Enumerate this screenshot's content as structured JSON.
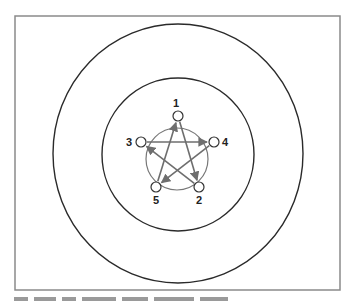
{
  "diagram": {
    "type": "communication-network",
    "shape": "star-pentagram",
    "frame": {
      "x": 15,
      "y": 16,
      "width": 325,
      "height": 274,
      "stroke": "#8a8a8a"
    },
    "outer_ring": {
      "cx": 178,
      "cy": 153.5,
      "rx": 125,
      "ry": 129.5,
      "stroke": "#2a2a2a"
    },
    "inner_ring": {
      "cx": 178,
      "cy": 154.5,
      "rx": 76,
      "ry": 76.5,
      "stroke": "#2a2a2a"
    },
    "hub_circle": {
      "cx": 177,
      "cy": 159,
      "r": 31,
      "stroke": "#777777"
    },
    "nodes": [
      {
        "id": "1",
        "label": "1",
        "cx": 178,
        "cy": 116
      },
      {
        "id": "2",
        "label": "2",
        "cx": 199,
        "cy": 187
      },
      {
        "id": "3",
        "label": "3",
        "cx": 141,
        "cy": 142
      },
      {
        "id": "4",
        "label": "4",
        "cx": 214,
        "cy": 142
      },
      {
        "id": "5",
        "label": "5",
        "cx": 156,
        "cy": 187
      }
    ],
    "edges": [
      {
        "from": "1",
        "to": "2"
      },
      {
        "from": "2",
        "to": "3"
      },
      {
        "from": "3",
        "to": "4"
      },
      {
        "from": "4",
        "to": "5"
      },
      {
        "from": "5",
        "to": "1"
      }
    ],
    "edge_color": "#6e6e6e",
    "node_color": "#333333",
    "caption_visible": "clipped"
  }
}
